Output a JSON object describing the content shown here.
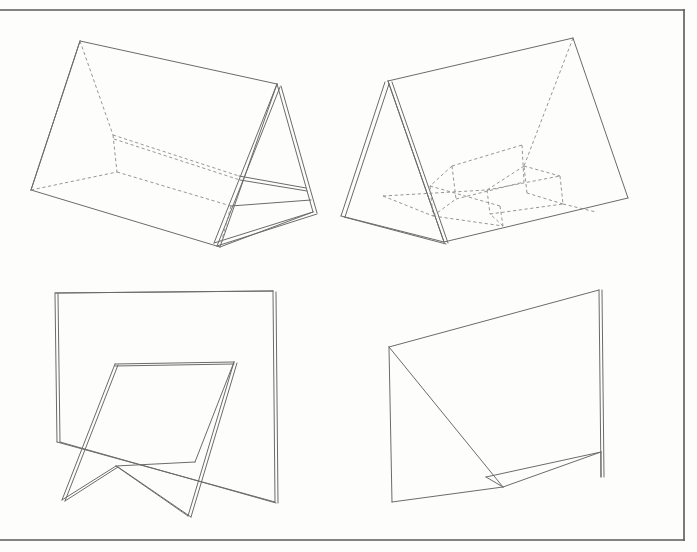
{
  "document": {
    "kind": "technical-line-drawing",
    "title": "",
    "background_color": "#fdfdfc",
    "line_color": "#6b6b6b",
    "dashed_line_color": "#8a8a8a",
    "frame_color": "#5a5a5a",
    "width": 697,
    "height": 552,
    "figure_count": 4
  },
  "frame": {
    "name": "page-border",
    "top_y": 10,
    "bottom_y": 540,
    "right_x": 684,
    "left_x": 0,
    "paths": [
      "M 0 10 L 684 10",
      "M 684 10 L 684 540",
      "M 684 540 L 0 540"
    ]
  },
  "figures": [
    {
      "id": "figure-1",
      "label": "triangular-prism-tent-with-interior-shelf",
      "position": "top-left",
      "solid_paths": [
        "M 80 41 L 277 84",
        "M 80 41 L 31 190",
        "M 31 190 L 220 247",
        "M 220 247 L 277 84",
        "M 277 84 L 313 212",
        "M 281 86 L 317 213",
        "M 277 84 L 214 243",
        "M 280 87 L 217 246",
        "M 214 243 L 313 212",
        "M 217 246 L 317 214",
        "M 220 247 L 313 212",
        "M 31 190 L 80 41",
        "M 239 176 L 306 188",
        "M 240 180 L 307 191",
        "M 231 206 L 311 200"
      ],
      "dashed_paths": [
        "M 80 41 L 113 135",
        "M 113 135 L 117 172",
        "M 113 135 L 239 176",
        "M 114 139 L 240 180",
        "M 31 190 L 117 172",
        "M 117 172 L 231 206",
        "M 231 206 L 220 247"
      ]
    },
    {
      "id": "figure-2",
      "label": "open-folded-panel-with-hidden-inner-folds",
      "position": "top-right",
      "solid_paths": [
        "M 388 81 L 573 38",
        "M 573 38 L 628 198",
        "M 628 198 L 444 242",
        "M 444 242 L 388 81",
        "M 385 82 L 341 216",
        "M 389 84 L 345 217",
        "M 388 81 L 444 242",
        "M 392 82 L 448 243",
        "M 341 216 L 444 242",
        "M 344 217 L 446 244"
      ],
      "dashed_paths": [
        "M 573 38 L 524 166",
        "M 524 166 L 487 190",
        "M 452 166 L 522 145",
        "M 452 166 L 456 199",
        "M 456 199 L 524 182",
        "M 522 145 L 524 182",
        "M 452 166 L 430 186",
        "M 430 186 L 433 216",
        "M 433 216 L 456 199",
        "M 430 186 L 500 206",
        "M 433 216 L 503 226",
        "M 500 206 L 503 226",
        "M 524 166 L 560 176",
        "M 560 176 L 563 204",
        "M 563 204 L 527 193",
        "M 527 193 L 524 166",
        "M 487 190 L 560 176",
        "M 487 190 L 490 214",
        "M 490 214 L 563 204",
        "M 383 196 L 487 190",
        "M 383 196 L 433 216",
        "M 503 226 L 490 214",
        "M 563 204 L 596 212"
      ]
    },
    {
      "id": "figure-3",
      "label": "tall-back-panel-with-front-folded-stand",
      "position": "bottom-left",
      "solid_paths": [
        "M 55 293 L 273 291",
        "M 55 294 L 57 442",
        "M 58 294 L 60 442",
        "M 273 291 L 275 502",
        "M 276 292 L 278 503",
        "M 55 293 L 273 291",
        "M 57 442 L 275 502",
        "M 60 442 L 276 503",
        "M 115 364 L 234 362",
        "M 115 366 L 234 364",
        "M 115 364 L 62 500",
        "M 118 365 L 65 501",
        "M 234 362 L 188 516",
        "M 237 363 L 191 517",
        "M 62 500 L 116 466",
        "M 65 501 L 118 467",
        "M 116 466 L 188 516",
        "M 118 467 L 191 517",
        "M 116 466 L 195 462",
        "M 234 362 L 195 462"
      ],
      "dashed_paths": []
    },
    {
      "id": "figure-4",
      "label": "panel-with-diagonal-fold-and-upright-flap",
      "position": "bottom-right",
      "solid_paths": [
        "M 389 347 L 599 290",
        "M 599 290 L 601 477",
        "M 602 290 L 604 477",
        "M 389 347 L 392 502",
        "M 389 347 L 503 487",
        "M 503 487 L 392 502",
        "M 503 487 L 601 452",
        "M 503 487 L 486 477",
        "M 486 477 L 601 452",
        "M 601 452 L 601 477"
      ],
      "dashed_paths": []
    }
  ]
}
